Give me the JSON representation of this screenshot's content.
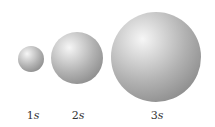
{
  "diagram": {
    "spheres": [
      {
        "label_num": "1",
        "label_var": "s",
        "cx": 31,
        "cy": 59,
        "r": 13
      },
      {
        "label_num": "2",
        "label_var": "s",
        "cx": 77,
        "cy": 58,
        "r": 26
      },
      {
        "label_num": "3",
        "label_var": "s",
        "cx": 156,
        "cy": 57,
        "r": 45
      }
    ]
  },
  "colors": {
    "background": "#ffffff",
    "sphere_highlight": "#f6f6f6",
    "sphere_shadow": "#7a7a7a",
    "label_text": "#333333"
  }
}
